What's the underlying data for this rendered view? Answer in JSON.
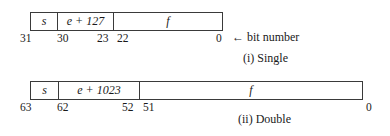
{
  "single": {
    "fields": {
      "sign": "s",
      "exponent": "e + 127",
      "fraction": "f"
    },
    "bits": {
      "b31": "31",
      "b30": "30",
      "b23": "23",
      "b22": "22",
      "b0": "0"
    },
    "bit_number_label": "← bit number",
    "caption": "(i) Single"
  },
  "double": {
    "fields": {
      "sign": "s",
      "exponent": "e + 1023",
      "fraction": "f"
    },
    "bits": {
      "b63": "63",
      "b62": "62",
      "b52": "52",
      "b51": "51",
      "b0": "0"
    },
    "caption": "(ii) Double"
  }
}
